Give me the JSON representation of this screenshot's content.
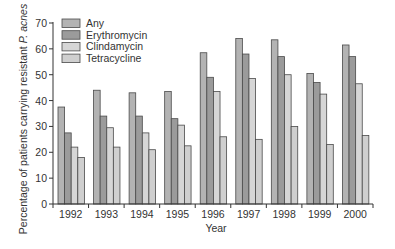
{
  "chart_data": {
    "type": "bar",
    "title": "",
    "xlabel": "Year",
    "ylabel": "Percentage of patients carrying resistant P. acnes",
    "ylabel_plain": "Percentage of patients carrying resistant ",
    "ylabel_italic": "P. acnes",
    "ylim": [
      0,
      70
    ],
    "yticks": [
      0,
      10,
      20,
      30,
      40,
      50,
      60,
      70
    ],
    "grid": false,
    "legend_position": "upper-left",
    "categories": [
      "1992",
      "1993",
      "1994",
      "1995",
      "1996",
      "1997",
      "1998",
      "1999",
      "2000"
    ],
    "series": [
      {
        "name": "Any",
        "color": "#b3b3b3",
        "values": [
          37.5,
          44,
          43,
          43.5,
          58.5,
          64,
          63.5,
          50.5,
          61.5
        ]
      },
      {
        "name": "Erythromycin",
        "color": "#9b9b9b",
        "values": [
          27.5,
          34,
          34,
          33,
          49,
          58,
          57,
          47,
          57
        ]
      },
      {
        "name": "Clindamycin",
        "color": "#d6d6d6",
        "values": [
          22,
          29.5,
          27.5,
          30.5,
          43.5,
          48.5,
          50,
          42.5,
          46.5
        ]
      },
      {
        "name": "Tetracycline",
        "color": "#cfcfcf",
        "values": [
          18,
          22,
          21,
          22.5,
          26,
          25,
          30,
          23,
          26.5
        ]
      }
    ]
  }
}
